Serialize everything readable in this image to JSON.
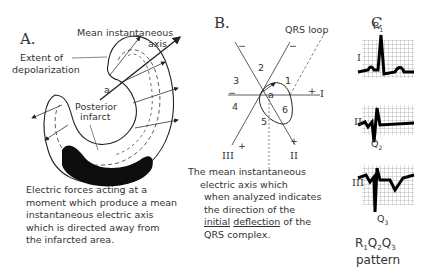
{
  "panels": {
    "A": {
      "label": "A.",
      "annotations": {
        "mean_axis_1": "Mean instantaneous",
        "mean_axis_2": "axis",
        "extent_1": "Extent of",
        "extent_2": "depolarization",
        "point_a": "a",
        "infarct_1": "Posterior",
        "infarct_2": "infarct"
      },
      "caption": [
        "Electric  forces acting at a",
        "moment which produce  a mean",
        "instantaneous electric axis",
        "which is directed away from",
        "the infarcted area."
      ]
    },
    "B": {
      "label": "B.",
      "loop_label": "QRS loop",
      "sectors": [
        "1",
        "2",
        "3",
        "4",
        "5",
        "6"
      ],
      "point_a": "a",
      "leads": {
        "I": "I",
        "II": "II",
        "III": "III"
      },
      "signs": {
        "plus": "+",
        "minus": "−"
      },
      "caption": {
        "line1": "The mean instantaneous",
        "line2": "electric  axis which",
        "line3": "when analyzed indicates",
        "line4": "the direction of the",
        "line5_u1": "initial",
        "line5_u2": "deflection",
        "line5_rest": " of the",
        "line6": "QRS complex."
      }
    },
    "C": {
      "label": "C",
      "leads": [
        "I",
        "II",
        "III"
      ],
      "wave_labels": {
        "R1": "R",
        "R1_sub": "1",
        "Q2": "Q",
        "Q2_sub": "2",
        "Q3": "Q",
        "Q3_sub": "3"
      },
      "pattern": {
        "R": "R",
        "r_sub": "1",
        "Q": "Q",
        "q2_sub": "2",
        "q3_sub": "3",
        "word": "pattern"
      }
    }
  }
}
